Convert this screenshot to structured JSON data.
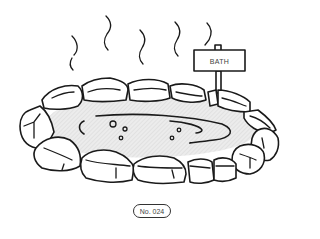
{
  "illustration": {
    "subject": "hot spring bath surrounded by rocks with steam and sign",
    "sign": {
      "label": "BATH"
    },
    "colors": {
      "ink": "#1a1a1a",
      "water": "#e6e6e6",
      "background": "#ffffff"
    }
  },
  "badge": {
    "label": "No. 024"
  }
}
